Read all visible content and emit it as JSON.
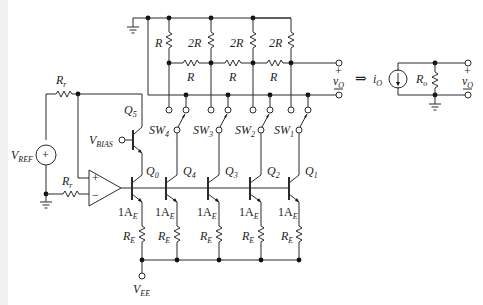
{
  "figure": {
    "labels": {
      "r_top_left": "R",
      "r_2r_3": "2R",
      "r_2r_2": "2R",
      "r_2r_1": "2R",
      "r_series_1": "R",
      "r_series_2": "R",
      "r_series_3": "R",
      "rr_top": "R",
      "rr_top_sub": "r",
      "rr_bot": "R",
      "rr_bot_sub": "r",
      "vref": "V",
      "vref_sub": "REF",
      "vbias": "V",
      "vbias_sub": "BIAS",
      "q5": "Q",
      "q5_sub": "5",
      "q0": "Q",
      "q0_sub": "0",
      "q4": "Q",
      "q4_sub": "4",
      "q3": "Q",
      "q3_sub": "3",
      "q2": "Q",
      "q2_sub": "2",
      "q1": "Q",
      "q1_sub": "1",
      "sw4": "SW",
      "sw4_sub": "4",
      "sw3": "SW",
      "sw3_sub": "3",
      "sw2": "SW",
      "sw2_sub": "2",
      "sw1": "SW",
      "sw1_sub": "1",
      "ae_prefix": "1A",
      "ae_sub": "E",
      "re": "R",
      "re_sub": "E",
      "vee": "V",
      "vee_sub": "EE",
      "vo": "v",
      "vo_sub": "O",
      "plus": "+",
      "minus": "−",
      "arrow": "⇒",
      "io": "i",
      "io_sub": "O",
      "ro": "R",
      "ro_sub": "o",
      "opamp_plus": "+",
      "opamp_minus": "−"
    }
  }
}
